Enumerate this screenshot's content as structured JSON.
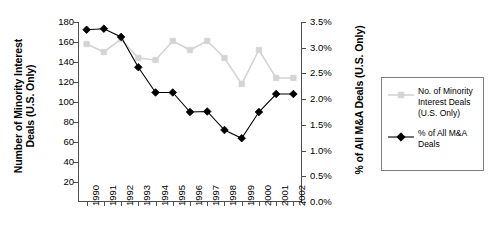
{
  "chart_data": {
    "type": "line",
    "title": "",
    "xlabel": "",
    "categories": [
      "1990",
      "1991",
      "1992",
      "1993",
      "1994",
      "1995",
      "1996",
      "1997",
      "1998",
      "1999",
      "2000",
      "2001",
      "2002"
    ],
    "grid": false,
    "legend_position": "right-outside",
    "series": [
      {
        "name": "No. of Minority Interest Deals (U.S. Only)",
        "axis": "left",
        "marker": "square",
        "color": "#d4d4d4",
        "values": [
          158,
          150,
          163,
          144,
          142,
          161,
          152,
          161,
          144,
          118,
          152,
          124,
          124
        ]
      },
      {
        "name": "% of All M&A Deals",
        "axis": "right",
        "marker": "diamond",
        "color": "#000000",
        "values": [
          3.35,
          3.37,
          3.21,
          2.62,
          2.13,
          2.13,
          1.75,
          1.76,
          1.4,
          1.24,
          1.75,
          2.1,
          2.1
        ]
      }
    ],
    "left_axis": {
      "label": "Number of Minority Interest\nDeals (U.S. Only)",
      "ticks": [
        20,
        40,
        60,
        80,
        100,
        120,
        140,
        160,
        180
      ],
      "tick_labels": [
        "20",
        "40",
        "60",
        "80",
        "100",
        "120",
        "140",
        "160",
        "180"
      ],
      "ylim": [
        0,
        180
      ]
    },
    "right_axis": {
      "label": "% of All M&A Deals (U.S. Only)",
      "ticks": [
        0.0,
        0.5,
        1.0,
        1.5,
        2.0,
        2.5,
        3.0,
        3.5
      ],
      "tick_labels": [
        "0.0%",
        "0.5%",
        "1.0%",
        "1.5%",
        "2.0%",
        "2.5%",
        "3.0%",
        "3.5%"
      ],
      "ylim": [
        0,
        3.5
      ]
    }
  },
  "legend": {
    "entries": [
      {
        "label": "No. of Minority\nInterest Deals\n(U.S. Only)",
        "marker": "square-marker",
        "color": "#d4d4d4"
      },
      {
        "label": "% of All M&A\nDeals",
        "marker": "diamond-marker",
        "color": "#000000"
      }
    ]
  }
}
